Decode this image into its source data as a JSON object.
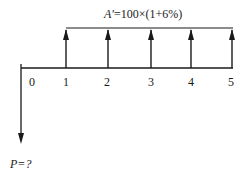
{
  "diagram": {
    "type": "cash-flow-diagram",
    "annuity_label_var": "A'",
    "annuity_label_expr": "=100×(1+6%)",
    "present_value_label": "P=?",
    "periods": [
      "0",
      "1",
      "2",
      "3",
      "4",
      "5"
    ],
    "inflow_periods": [
      1,
      2,
      3,
      4,
      5
    ],
    "outflow_period": 0,
    "line_color": "#1a1a1a"
  }
}
